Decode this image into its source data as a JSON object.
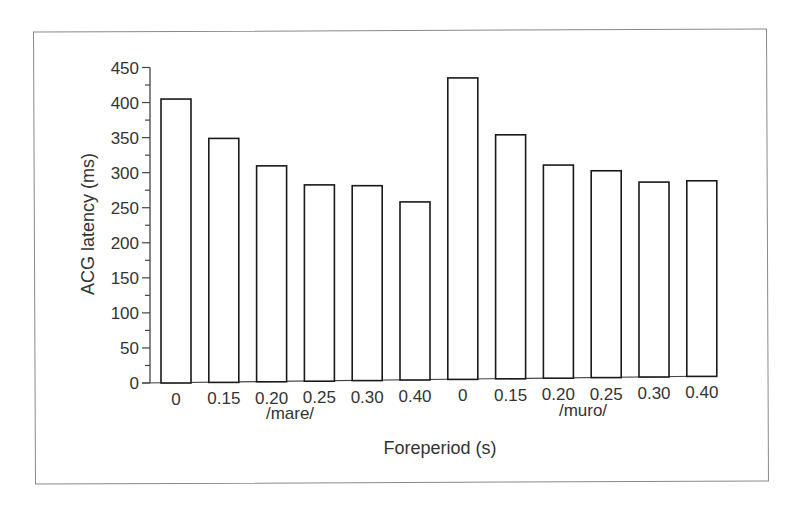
{
  "chart_data": {
    "type": "bar",
    "title": "",
    "xlabel": "Foreperiod (s)",
    "ylabel": "ACG latency (ms)",
    "ylim": [
      0,
      450
    ],
    "yticks": [
      0,
      50,
      100,
      150,
      200,
      250,
      300,
      350,
      400,
      450
    ],
    "yminor_step": 25,
    "grid": false,
    "legend": null,
    "groups": [
      {
        "name": "/mare/",
        "categories": [
          "0",
          "0.15",
          "0.20",
          "0.25",
          "0.30",
          "0.40"
        ],
        "values": [
          405,
          348,
          308,
          280,
          278,
          254
        ]
      },
      {
        "name": "/muro/",
        "categories": [
          "0",
          "0.15",
          "0.20",
          "0.25",
          "0.30",
          "0.40"
        ],
        "values": [
          430,
          348,
          304,
          295,
          278,
          279
        ]
      }
    ],
    "categories": [
      "0",
      "0.15",
      "0.20",
      "0.25",
      "0.30",
      "0.40",
      "0",
      "0.15",
      "0.20",
      "0.25",
      "0.30",
      "0.40"
    ],
    "values": [
      405,
      348,
      308,
      280,
      278,
      254,
      430,
      348,
      304,
      295,
      278,
      279
    ],
    "bar_fill": "#ffffff",
    "bar_stroke": "#1a1a1a"
  }
}
